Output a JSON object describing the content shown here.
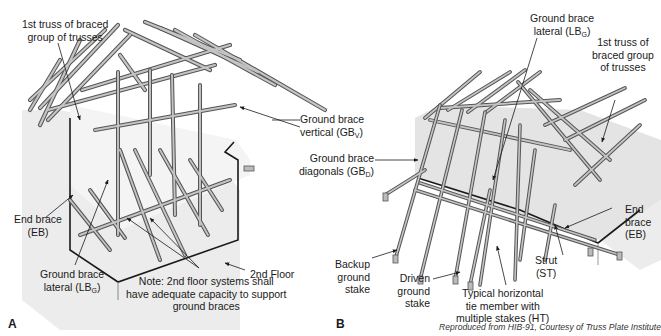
{
  "figure_a": {
    "panel_label": "A",
    "labels": {
      "first_truss_line1": "1st truss of braced",
      "first_truss_line2": "group of trusses",
      "end_brace_line1": "End brace",
      "end_brace_line2": "(EB)",
      "ground_brace_lateral_line1": "Ground brace",
      "ground_brace_lateral_line2": "lateral (LB",
      "ground_brace_lateral_sub": "G",
      "ground_brace_lateral_close": ")",
      "second_floor": "2nd Floor",
      "note_line1": "Note: 2nd floor systems shall",
      "note_line2": "have adequate capacity to support",
      "note_line3": "ground braces"
    }
  },
  "shared_labels": {
    "ground_brace_vertical_line1": "Ground brace",
    "ground_brace_vertical_line2": "vertical (GB",
    "ground_brace_vertical_sub": "V",
    "ground_brace_vertical_close": ")",
    "ground_brace_diagonals_line1": "Ground brace",
    "ground_brace_diagonals_line2": "diagonals (GB",
    "ground_brace_diagonals_sub": "D",
    "ground_brace_diagonals_close": ")"
  },
  "figure_b": {
    "panel_label": "B",
    "labels": {
      "ground_brace_lateral_line1": "Ground brace",
      "ground_brace_lateral_line2": "lateral (LB",
      "ground_brace_lateral_sub": "G",
      "ground_brace_lateral_close": ")",
      "first_truss_line1": "1st truss of",
      "first_truss_line2": "braced group",
      "first_truss_line3": "of trusses",
      "end_brace_line1": "End",
      "end_brace_line2": "brace",
      "end_brace_line3": "(EB)",
      "strut_line1": "Strut",
      "strut_line2": "(ST)",
      "backup_stake_line1": "Backup",
      "backup_stake_line2": "ground",
      "backup_stake_line3": "stake",
      "driven_stake_line1": "Driven",
      "driven_stake_line2": "ground",
      "driven_stake_line3": "stake",
      "horizontal_tie_line1": "Typical horizontal",
      "horizontal_tie_line2": "tie member with",
      "horizontal_tie_line3": "multiple stakes (HT)"
    }
  },
  "credit": "Reproduced from HIB-91, Courtesy of Truss Plate Institute",
  "colors": {
    "wall_shade": "#e6e6e6",
    "member_fill": "#bdbdbd",
    "member_edge": "#555555",
    "outline": "#1a1a1a"
  }
}
